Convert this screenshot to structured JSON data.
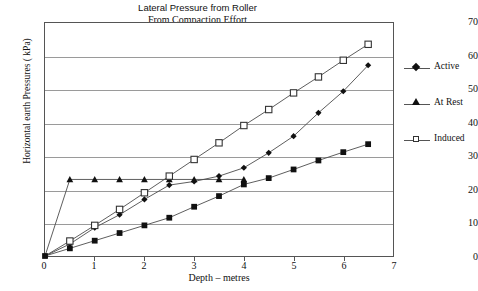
{
  "chart_data": {
    "type": "line",
    "title": "Lateral Pressure from Roller",
    "subtitle": "From Compaction Effort",
    "xlabel": "Depth – metres",
    "ylabel": "Horizontal earth Pressures ( kPa)",
    "xlim": [
      0,
      7
    ],
    "ylim": [
      0,
      70
    ],
    "xticks": [
      0,
      1,
      2,
      3,
      4,
      5,
      6,
      7
    ],
    "yticks": [
      0,
      10,
      20,
      30,
      40,
      50,
      60,
      70
    ],
    "grid": "horizontal",
    "legend_position": "right",
    "series": [
      {
        "name": "Active",
        "marker": "diamond",
        "x": [
          0,
          0.5,
          1,
          1.5,
          2,
          2.5,
          3,
          3.5,
          4,
          4.5,
          5,
          5.5,
          6,
          6.5
        ],
        "y": [
          0,
          3.6,
          8.5,
          12.4,
          17.0,
          21.3,
          22.4,
          24.0,
          26.5,
          31.0,
          36.0,
          43.0,
          49.5,
          57.3
        ]
      },
      {
        "name": "At Rest",
        "marker": "triangle",
        "x": [
          0,
          0.5,
          1,
          1.5,
          2,
          2.5,
          3,
          3.5,
          4
        ],
        "y": [
          0,
          23.0,
          23.0,
          23.0,
          23.0,
          23.0,
          23.0,
          23.0,
          23.0
        ]
      },
      {
        "name": "Induced",
        "marker": "open-square",
        "x": [
          0,
          0.5,
          1,
          1.5,
          2,
          2.5,
          3,
          3.5,
          4,
          4.5,
          5,
          5.5,
          6,
          6.5
        ],
        "y": [
          0,
          4.5,
          9.2,
          14.0,
          19.0,
          24.0,
          29.0,
          34.0,
          39.2,
          44.0,
          49.0,
          53.8,
          58.8,
          63.6
        ]
      },
      {
        "name": "Series 4",
        "marker": "filled-square",
        "x": [
          0,
          0.5,
          1,
          1.5,
          2,
          2.5,
          3,
          3.5,
          4,
          4.5,
          5,
          5.5,
          6,
          6.5
        ],
        "y": [
          0,
          2.3,
          4.6,
          6.9,
          9.2,
          11.5,
          14.8,
          18.0,
          21.5,
          23.4,
          26.0,
          28.7,
          31.2,
          33.6
        ]
      }
    ]
  },
  "legend": {
    "items": [
      {
        "label": "Active",
        "marker": "diamond"
      },
      {
        "label": "At Rest",
        "marker": "triangle"
      },
      {
        "label": "Induced",
        "marker": "open-square"
      }
    ]
  }
}
